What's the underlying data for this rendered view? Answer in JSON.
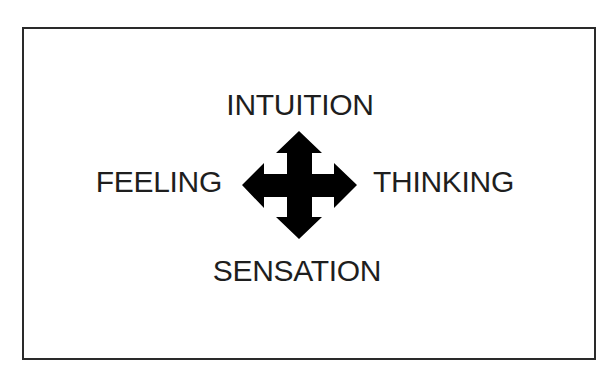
{
  "diagram": {
    "type": "four-way-axis",
    "labels": {
      "top": "INTUITION",
      "left": "FEELING",
      "right": "THINKING",
      "bottom": "SENSATION"
    },
    "center_icon": "four-way-arrow-icon",
    "colors": {
      "frame": "#2a2a2a",
      "text": "#1e1e1e",
      "arrow": "#000000",
      "background": "#ffffff"
    }
  }
}
